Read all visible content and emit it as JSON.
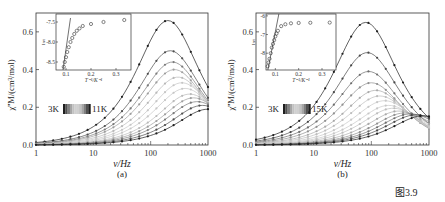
{
  "figure_caption": "图3.9",
  "panels": [
    {
      "label": "(a)",
      "legend_low": "3K",
      "legend_high": "11K"
    },
    {
      "label": "(b)",
      "legend_low": "3K",
      "legend_high": "15K"
    }
  ],
  "chart_data": [
    {
      "type": "line",
      "title": "",
      "panel": "(a)",
      "xlabel": "ν/Hz",
      "ylabel": "χ''M/(cm3/mol)",
      "xscale": "log",
      "xlim": [
        1,
        1000
      ],
      "ylim": [
        0,
        0.7
      ],
      "xticks": [
        "1",
        "10",
        "100",
        "1000"
      ],
      "yticks": [
        "0.0",
        "0.2",
        "0.4",
        "0.6"
      ],
      "legend": {
        "low": "3K",
        "high": "11K",
        "gradient": "dark-light-dark"
      },
      "series_description": "Out-of-phase ac susceptibility curves from 3K to 11K; peak moves from ~200 Hz (0.66) toward higher frequency with decreasing height",
      "series": [
        {
          "name": "3K",
          "peak_freq": 200,
          "peak": 0.66
        },
        {
          "name": "curve2",
          "peak_freq": 220,
          "peak": 0.5
        },
        {
          "name": "curve3",
          "peak_freq": 240,
          "peak": 0.44
        },
        {
          "name": "curve4",
          "peak_freq": 260,
          "peak": 0.4
        },
        {
          "name": "curve5",
          "peak_freq": 300,
          "peak": 0.36
        },
        {
          "name": "curve6",
          "peak_freq": 350,
          "peak": 0.33
        },
        {
          "name": "curve7",
          "peak_freq": 400,
          "peak": 0.3
        },
        {
          "name": "curve8",
          "peak_freq": 480,
          "peak": 0.27
        },
        {
          "name": "curve9",
          "peak_freq": 560,
          "peak": 0.25
        },
        {
          "name": "curve10",
          "peak_freq": 650,
          "peak": 0.23
        },
        {
          "name": "curve11",
          "peak_freq": 800,
          "peak": 0.21
        },
        {
          "name": "11K",
          "peak_freq": 1000,
          "peak": 0.19
        }
      ],
      "inset": {
        "type": "scatter",
        "xlabel": "T^-1/K^-1",
        "ylabel": "lnτ",
        "xticks": [
          "0.1",
          "0.2",
          "0.3"
        ],
        "yticks": [
          "-7.5",
          "-8.0",
          "-8.5"
        ],
        "xlim": [
          0.06,
          0.36
        ],
        "ylim": [
          -8.7,
          -7.3
        ],
        "points": [
          [
            0.091,
            -8.62
          ],
          [
            0.095,
            -8.5
          ],
          [
            0.1,
            -8.38
          ],
          [
            0.105,
            -8.25
          ],
          [
            0.111,
            -8.13
          ],
          [
            0.118,
            -8.0
          ],
          [
            0.125,
            -7.9
          ],
          [
            0.133,
            -7.8
          ],
          [
            0.143,
            -7.72
          ],
          [
            0.154,
            -7.66
          ],
          [
            0.167,
            -7.6
          ],
          [
            0.2,
            -7.55
          ],
          [
            0.25,
            -7.5
          ],
          [
            0.333,
            -7.45
          ]
        ],
        "fit_line": [
          [
            0.088,
            -8.7
          ],
          [
            0.118,
            -7.4
          ]
        ]
      }
    },
    {
      "type": "line",
      "title": "",
      "panel": "(b)",
      "xlabel": "ν/Hz",
      "ylabel": "χ''M/(cm3/mol)",
      "xscale": "log",
      "xlim": [
        1,
        1000
      ],
      "ylim": [
        0,
        0.7
      ],
      "xticks": [
        "1",
        "10",
        "100",
        "1000"
      ],
      "yticks": [
        "0.0",
        "0.2",
        "0.4",
        "0.6"
      ],
      "legend": {
        "low": "3K",
        "high": "15K",
        "gradient": "dark-light-dark"
      },
      "series_description": "Out-of-phase ac susceptibility curves from 3K to 15K; peak moves from ~80 Hz (0.65) toward higher frequency with decreasing height",
      "series": [
        {
          "name": "3K",
          "peak_freq": 80,
          "peak": 0.65
        },
        {
          "name": "curve2",
          "peak_freq": 85,
          "peak": 0.49
        },
        {
          "name": "curve3",
          "peak_freq": 90,
          "peak": 0.39
        },
        {
          "name": "curve4",
          "peak_freq": 100,
          "peak": 0.33
        },
        {
          "name": "curve5",
          "peak_freq": 120,
          "peak": 0.29
        },
        {
          "name": "curve6",
          "peak_freq": 140,
          "peak": 0.26
        },
        {
          "name": "curve7",
          "peak_freq": 170,
          "peak": 0.235
        },
        {
          "name": "curve8",
          "peak_freq": 200,
          "peak": 0.21
        },
        {
          "name": "curve9",
          "peak_freq": 240,
          "peak": 0.195
        },
        {
          "name": "curve10",
          "peak_freq": 300,
          "peak": 0.18
        },
        {
          "name": "curve11",
          "peak_freq": 380,
          "peak": 0.17
        },
        {
          "name": "curve12",
          "peak_freq": 480,
          "peak": 0.165
        },
        {
          "name": "curve13",
          "peak_freq": 600,
          "peak": 0.16
        },
        {
          "name": "15K",
          "peak_freq": 800,
          "peak": 0.155
        }
      ],
      "inset": {
        "type": "scatter",
        "xlabel": "T^-1/K^-1",
        "ylabel": "lnτ",
        "xticks": [
          "0.1",
          "0.2",
          "0.3"
        ],
        "yticks": [
          "-6",
          "-7",
          "-8"
        ],
        "xlim": [
          0.06,
          0.36
        ],
        "ylim": [
          -8.9,
          -5.9
        ],
        "points": [
          [
            0.067,
            -8.7
          ],
          [
            0.071,
            -8.5
          ],
          [
            0.075,
            -8.3
          ],
          [
            0.08,
            -8.0
          ],
          [
            0.085,
            -7.7
          ],
          [
            0.09,
            -7.5
          ],
          [
            0.095,
            -7.3
          ],
          [
            0.1,
            -7.1
          ],
          [
            0.105,
            -6.95
          ],
          [
            0.111,
            -6.8
          ],
          [
            0.125,
            -6.55
          ],
          [
            0.143,
            -6.45
          ],
          [
            0.167,
            -6.4
          ],
          [
            0.2,
            -6.38
          ],
          [
            0.25,
            -6.37
          ],
          [
            0.333,
            -6.36
          ]
        ],
        "fit_line": [
          [
            0.068,
            -8.9
          ],
          [
            0.115,
            -5.9
          ]
        ]
      }
    }
  ]
}
